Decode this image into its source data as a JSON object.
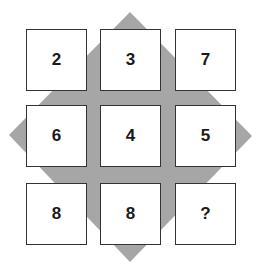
{
  "puzzle": {
    "background_color": "#a6a6a6",
    "cell_border_color": "#333333",
    "grid": [
      [
        "2",
        "3",
        "7"
      ],
      [
        "6",
        "4",
        "5"
      ],
      [
        "8",
        "8",
        "?"
      ]
    ],
    "cells": [
      {
        "row": 0,
        "col": 0,
        "value": "2"
      },
      {
        "row": 0,
        "col": 1,
        "value": "3"
      },
      {
        "row": 0,
        "col": 2,
        "value": "7"
      },
      {
        "row": 1,
        "col": 0,
        "value": "6"
      },
      {
        "row": 1,
        "col": 1,
        "value": "4"
      },
      {
        "row": 1,
        "col": 2,
        "value": "5"
      },
      {
        "row": 2,
        "col": 0,
        "value": "8"
      },
      {
        "row": 2,
        "col": 1,
        "value": "8"
      },
      {
        "row": 2,
        "col": 2,
        "value": "?"
      }
    ]
  }
}
